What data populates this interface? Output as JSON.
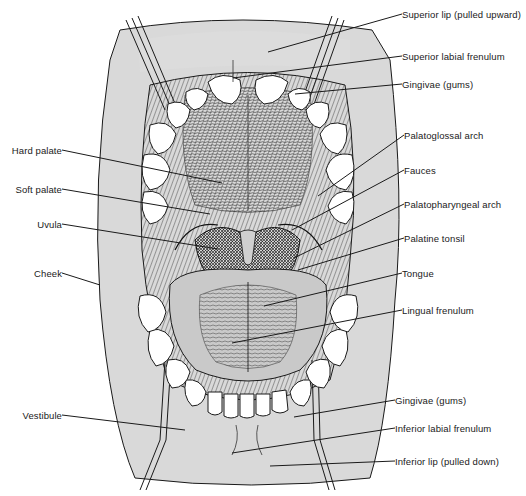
{
  "figure": {
    "colors": {
      "skin": "#d9d9d9",
      "line": "#1a1a1a",
      "tooth": "#ffffff",
      "throat": "#3a3a3a",
      "tongue": "#bdbdbd",
      "background": "#ffffff"
    }
  },
  "labels": {
    "right": [
      {
        "id": "superior-lip",
        "text": "Superior lip (pulled upward)",
        "x": 402,
        "y": 14,
        "tx": 268,
        "ty": 52
      },
      {
        "id": "superior-labial-frenulum",
        "text": "Superior labial frenulum",
        "x": 402,
        "y": 56,
        "tx": 233,
        "ty": 78
      },
      {
        "id": "gingivae-upper",
        "text": "Gingivae (gums)",
        "x": 402,
        "y": 84,
        "tx": 295,
        "ty": 94
      },
      {
        "id": "palatoglossal-arch",
        "text": "Palatoglossal arch",
        "x": 404,
        "y": 135,
        "tx": 318,
        "ty": 196
      },
      {
        "id": "fauces",
        "text": "Fauces",
        "x": 404,
        "y": 170,
        "tx": 292,
        "ty": 230
      },
      {
        "id": "palatopharyngeal-arch",
        "text": "Palatopharyngeal arch",
        "x": 404,
        "y": 204,
        "tx": 294,
        "ty": 258
      },
      {
        "id": "palatine-tonsil",
        "text": "Palatine tonsil",
        "x": 404,
        "y": 238,
        "tx": 298,
        "ty": 270
      },
      {
        "id": "tongue",
        "text": "Tongue",
        "x": 402,
        "y": 273,
        "tx": 264,
        "ty": 306
      },
      {
        "id": "lingual-frenulum",
        "text": "Lingual frenulum",
        "x": 402,
        "y": 310,
        "tx": 232,
        "ty": 343
      },
      {
        "id": "gingivae-lower",
        "text": "Gingivae (gums)",
        "x": 395,
        "y": 400,
        "tx": 294,
        "ty": 417
      },
      {
        "id": "inferior-labial-frenulum",
        "text": "Inferior labial frenulum",
        "x": 395,
        "y": 428,
        "tx": 232,
        "ty": 453
      },
      {
        "id": "inferior-lip",
        "text": "Inferior lip (pulled down)",
        "x": 395,
        "y": 461,
        "tx": 270,
        "ty": 466
      }
    ],
    "left": [
      {
        "id": "hard-palate",
        "text": "Hard palate",
        "x": 62,
        "y": 150,
        "tx": 222,
        "ty": 183
      },
      {
        "id": "soft-palate",
        "text": "Soft palate",
        "x": 62,
        "y": 189,
        "tx": 210,
        "ty": 214
      },
      {
        "id": "uvula",
        "text": "Uvula",
        "x": 62,
        "y": 224,
        "tx": 218,
        "ty": 249
      },
      {
        "id": "cheek",
        "text": "Cheek",
        "x": 62,
        "y": 273,
        "tx": 100,
        "ty": 285
      },
      {
        "id": "vestibule",
        "text": "Vestibule",
        "x": 62,
        "y": 415,
        "tx": 185,
        "ty": 430
      }
    ]
  }
}
